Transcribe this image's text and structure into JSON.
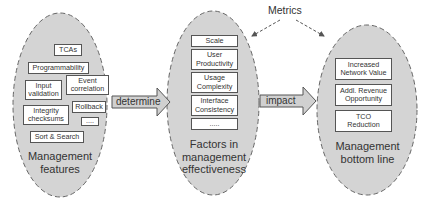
{
  "diagram": {
    "metrics_label": "Metrics",
    "arrows": {
      "determine": "determine",
      "impact": "impact"
    },
    "ellipses": [
      {
        "title": "Management\nfeatures",
        "items": [
          "TCAs",
          "Programmability",
          "Input\nvalidation",
          "Event\ncorrelation",
          "Rollback",
          "Integrity\nchecksums",
          "....",
          "Sort & Search"
        ]
      },
      {
        "title": "Factors in\nmanagement\neffectiveness",
        "items": [
          "Scale",
          "User\nProductivity",
          "Usage\nComplexity",
          "Interface\nConsistency",
          "....."
        ]
      },
      {
        "title": "Management\nbottom line",
        "items": [
          "Increased\nNetwork Value",
          "Addl. Revenue\nOpportunity",
          "TCO\nReduction"
        ]
      }
    ],
    "colors": {
      "ellipse_fill": "#d4d4d4",
      "ellipse_stroke": "#666666",
      "arrow_fill": "#d0d0d0",
      "box_fill": "#ffffff",
      "text": "#333333"
    }
  }
}
